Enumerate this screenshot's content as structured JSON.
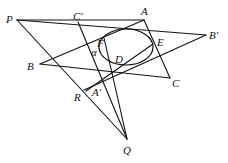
{
  "figure": {
    "points": {
      "P": {
        "label": "P",
        "x": 17,
        "y": 20,
        "lx": 6,
        "ly": 23
      },
      "A": {
        "label": "A",
        "x": 144,
        "y": 20,
        "lx": 141,
        "ly": 15
      },
      "B": {
        "label": "B",
        "x": 40,
        "y": 64,
        "lx": 27,
        "ly": 70
      },
      "C": {
        "label": "C",
        "x": 170,
        "y": 78,
        "lx": 172,
        "ly": 87
      },
      "A_prime": {
        "label": "A′",
        "x": 86,
        "y": 91,
        "lx": 92,
        "ly": 96
      },
      "B_prime": {
        "label": "B′",
        "x": 206,
        "y": 35,
        "lx": 209,
        "ly": 39
      },
      "C_prime": {
        "label": "C′",
        "x": 78,
        "y": 22,
        "lx": 73,
        "ly": 20
      },
      "D": {
        "label": "D",
        "x": 114,
        "y": 64,
        "lx": 115,
        "ly": 63
      },
      "E": {
        "label": "E",
        "x": 153,
        "y": 44,
        "lx": 157,
        "ly": 46
      },
      "F": {
        "label": "F",
        "x": 104,
        "y": 38,
        "lx": 97,
        "ly": 47
      },
      "Q": {
        "label": "Q",
        "x": 127,
        "y": 139,
        "lx": 123,
        "ly": 154
      },
      "R": {
        "label": "R",
        "x": 84,
        "y": 90,
        "lx": 74,
        "ly": 101
      }
    },
    "angle_label": {
      "label": "α",
      "lx": 91,
      "ly": 56
    },
    "ellipse": {
      "cx": 126,
      "cy": 47,
      "rx": 27,
      "ry": 18
    },
    "stroke_color": "#111111",
    "background": "#ffffff"
  }
}
